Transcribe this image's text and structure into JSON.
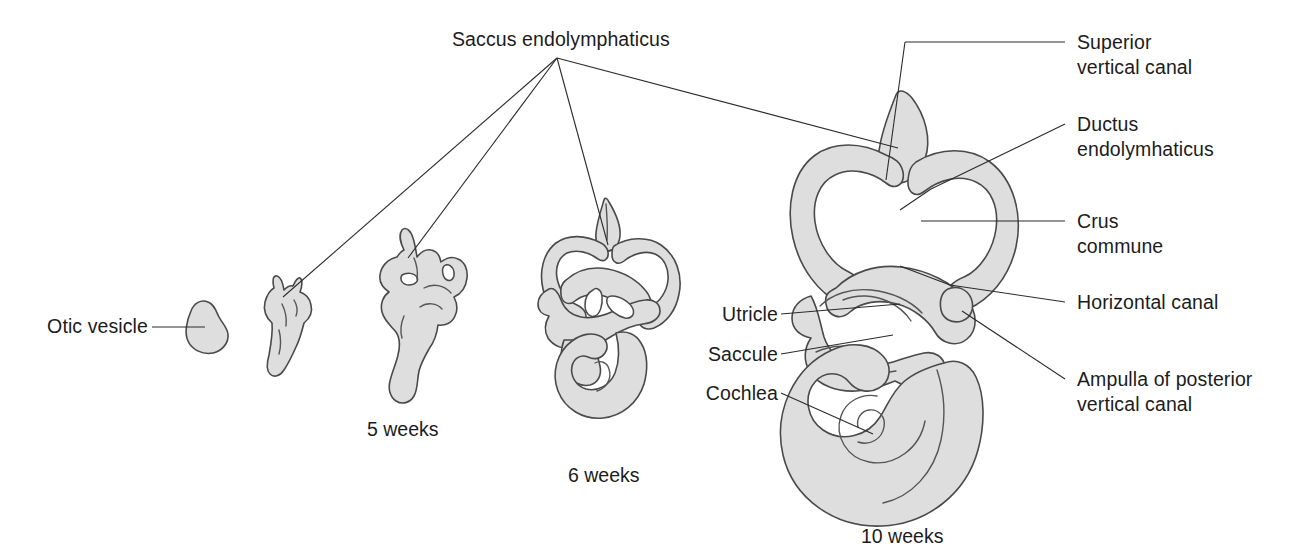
{
  "figure": {
    "title": "Saccus endolymphaticus",
    "colors": {
      "organ_fill": "#dedede",
      "organ_stroke": "#4a4a4a",
      "leader_line": "#2b2b2b",
      "text": "#1c1c1c",
      "background": "#ffffff"
    }
  },
  "callout_top": {
    "label": "Saccus endolymphaticus",
    "x": 452,
    "y": 27
  },
  "labels_left": [
    {
      "name": "otic-vesicle",
      "text": "Otic vesicle",
      "x": 58,
      "y": 297
    },
    {
      "name": "utricle",
      "text": "Utricle",
      "x": 700,
      "y": 300
    },
    {
      "name": "saccule",
      "text": "Saccule",
      "x": 684,
      "y": 340
    },
    {
      "name": "cochlea",
      "text": "Cochlea",
      "x": 687,
      "y": 379
    }
  ],
  "labels_right": [
    {
      "name": "superior-vertical-canal",
      "text": "Superior\nvertical canal",
      "x": 1077,
      "y": 29
    },
    {
      "name": "ductus-endolymhaticus",
      "text": "Ductus\nendolymhaticus",
      "x": 1077,
      "y": 110
    },
    {
      "name": "crus-commune",
      "text": "Crus\ncommune",
      "x": 1077,
      "y": 207
    },
    {
      "name": "horizontal-canal",
      "text": "Horizontal canal",
      "x": 1077,
      "y": 288
    },
    {
      "name": "ampulla-of-posterior-vertical-canal",
      "text": "Ampulla of posterior\nvertical canal",
      "x": 1077,
      "y": 366
    }
  ],
  "stage_captions": [
    {
      "name": "caption-5-weeks",
      "text": "5 weeks",
      "x": 367,
      "y": 418
    },
    {
      "name": "caption-6-weeks",
      "text": "6 weeks",
      "x": 568,
      "y": 464
    },
    {
      "name": "caption-10-weeks",
      "text": "10 weeks",
      "x": 861,
      "y": 525
    }
  ],
  "stages": [
    {
      "name": "otic-vesicle",
      "age": "4 weeks"
    },
    {
      "name": "early-labyrinth",
      "age": "4.5 weeks"
    },
    {
      "name": "labyrinth-5-weeks",
      "age": "5 weeks"
    },
    {
      "name": "labyrinth-6-weeks",
      "age": "6 weeks"
    },
    {
      "name": "labyrinth-10-weeks",
      "age": "10 weeks"
    }
  ],
  "structures": [
    "Saccus endolymphaticus",
    "Otic vesicle",
    "Superior vertical canal",
    "Ductus endolymhaticus",
    "Crus commune",
    "Horizontal canal",
    "Ampulla of posterior vertical canal",
    "Utricle",
    "Saccule",
    "Cochlea"
  ]
}
